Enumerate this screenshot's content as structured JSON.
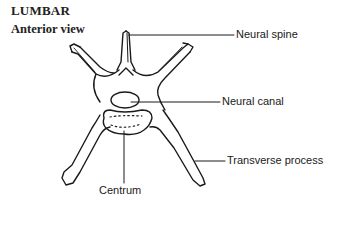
{
  "heading": {
    "title": "LUMBAR",
    "subtitle": "Anterior view"
  },
  "diagram": {
    "view": "Anterior view",
    "labels": [
      {
        "id": "neural_spine",
        "text": "Neural spine"
      },
      {
        "id": "neural_canal",
        "text": "Neural canal"
      },
      {
        "id": "transverse_process",
        "text": "Transverse process"
      },
      {
        "id": "centrum",
        "text": "Centrum"
      }
    ],
    "stroke_color": "#1a1a1a",
    "background_color": "#ffffff"
  }
}
